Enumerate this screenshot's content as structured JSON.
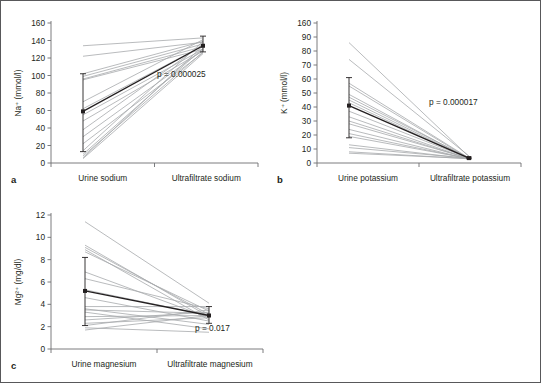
{
  "figure": {
    "background_color": "#ffffff",
    "border_color": "#58585a",
    "mean_color": "#231f20",
    "subject_line_color": "#a7a9ac",
    "axis_color": "#6d6e71"
  },
  "chart_data": [
    {
      "type": "line",
      "panel_letter": "a",
      "title": "",
      "xlabel": "",
      "ylabel": "Na⁺ (mmol/l)",
      "ylim": [
        0,
        160
      ],
      "ytick_labels": [
        "0",
        "20",
        "40",
        "60",
        "80",
        "100",
        "120",
        "140",
        "160"
      ],
      "yticks": [
        0,
        20,
        40,
        60,
        80,
        100,
        120,
        140,
        160
      ],
      "grid": false,
      "legend": "none",
      "categories": [
        "Urine sodium",
        "Ultrafiltrate sodium"
      ],
      "annotation": "p = 0.000025",
      "mean": {
        "values": [
          59,
          134
        ],
        "error_low": [
          13,
          127
        ],
        "error_high": [
          102,
          145
        ]
      },
      "series": [
        {
          "name": "subject-1",
          "values": [
            134,
            143
          ]
        },
        {
          "name": "subject-2",
          "values": [
            122,
            138
          ]
        },
        {
          "name": "subject-3",
          "values": [
            102,
            139
          ]
        },
        {
          "name": "subject-4",
          "values": [
            99,
            136
          ]
        },
        {
          "name": "subject-5",
          "values": [
            96,
            133
          ]
        },
        {
          "name": "subject-6",
          "values": [
            95,
            130
          ]
        },
        {
          "name": "subject-7",
          "values": [
            70,
            141
          ]
        },
        {
          "name": "subject-8",
          "values": [
            62,
            134
          ]
        },
        {
          "name": "subject-9",
          "values": [
            55,
            130
          ]
        },
        {
          "name": "subject-10",
          "values": [
            48,
            128
          ]
        },
        {
          "name": "subject-11",
          "values": [
            38,
            136
          ]
        },
        {
          "name": "subject-12",
          "values": [
            30,
            129
          ]
        },
        {
          "name": "subject-13",
          "values": [
            22,
            126
          ]
        },
        {
          "name": "subject-14",
          "values": [
            14,
            139
          ]
        },
        {
          "name": "subject-15",
          "values": [
            10,
            131
          ]
        },
        {
          "name": "subject-16",
          "values": [
            8,
            127
          ]
        },
        {
          "name": "subject-17",
          "values": [
            6,
            134
          ]
        },
        {
          "name": "subject-18",
          "values": [
            5,
            125
          ]
        }
      ]
    },
    {
      "type": "line",
      "panel_letter": "b",
      "title": "",
      "xlabel": "",
      "ylabel": "K⁺ (mmol/l)",
      "ylim": [
        0,
        100
      ],
      "ytick_labels": [
        "0",
        "10",
        "20",
        "30",
        "40",
        "50",
        "60",
        "70",
        "80",
        "90",
        "160"
      ],
      "yticks": [
        0,
        10,
        20,
        30,
        40,
        50,
        60,
        70,
        80,
        90,
        100
      ],
      "grid": false,
      "legend": "none",
      "categories": [
        "Urine potassium",
        "Ultrafiltrate potassium"
      ],
      "annotation": "p = 0.000017",
      "mean": {
        "values": [
          41,
          3.5
        ],
        "error_low": [
          18,
          3.0
        ],
        "error_high": [
          61,
          4.2
        ]
      },
      "series": [
        {
          "name": "subject-1",
          "values": [
            86,
            4.5
          ]
        },
        {
          "name": "subject-2",
          "values": [
            74,
            5.0
          ]
        },
        {
          "name": "subject-3",
          "values": [
            57,
            3.5
          ]
        },
        {
          "name": "subject-4",
          "values": [
            55,
            3.2
          ]
        },
        {
          "name": "subject-5",
          "values": [
            49,
            3.0
          ]
        },
        {
          "name": "subject-6",
          "values": [
            47,
            3.6
          ]
        },
        {
          "name": "subject-7",
          "values": [
            45,
            3.2
          ]
        },
        {
          "name": "subject-8",
          "values": [
            43,
            3.0
          ]
        },
        {
          "name": "subject-9",
          "values": [
            37,
            3.4
          ]
        },
        {
          "name": "subject-10",
          "values": [
            33,
            3.0
          ]
        },
        {
          "name": "subject-11",
          "values": [
            30,
            3.1
          ]
        },
        {
          "name": "subject-12",
          "values": [
            28,
            3.3
          ]
        },
        {
          "name": "subject-13",
          "values": [
            24,
            2.8
          ]
        },
        {
          "name": "subject-14",
          "values": [
            21,
            3.0
          ]
        },
        {
          "name": "subject-15",
          "values": [
            19,
            3.2
          ]
        },
        {
          "name": "subject-16",
          "values": [
            13,
            3.0
          ]
        },
        {
          "name": "subject-17",
          "values": [
            11,
            3.4
          ]
        },
        {
          "name": "subject-18",
          "values": [
            8,
            3.0
          ]
        },
        {
          "name": "subject-19",
          "values": [
            7,
            3.2
          ]
        }
      ]
    },
    {
      "type": "line",
      "panel_letter": "c",
      "title": "",
      "xlabel": "",
      "ylabel": "Mg²⁺ (mg/dl)",
      "ylim": [
        0,
        12
      ],
      "ytick_labels": [
        "0",
        "2",
        "4",
        "6",
        "8",
        "10",
        "12"
      ],
      "yticks": [
        0,
        2,
        4,
        6,
        8,
        10,
        12
      ],
      "grid": false,
      "legend": "none",
      "categories": [
        "Urine magnesium",
        "Ultrafiltrate magnesium"
      ],
      "annotation": "p = 0.017",
      "mean": {
        "values": [
          5.2,
          3.0
        ],
        "error_low": [
          2.1,
          2.3
        ],
        "error_high": [
          8.2,
          3.8
        ]
      },
      "series": [
        {
          "name": "subject-1",
          "values": [
            11.4,
            4.1
          ]
        },
        {
          "name": "subject-2",
          "values": [
            9.3,
            2.9
          ]
        },
        {
          "name": "subject-3",
          "values": [
            9.1,
            3.1
          ]
        },
        {
          "name": "subject-4",
          "values": [
            8.9,
            2.6
          ]
        },
        {
          "name": "subject-5",
          "values": [
            8.7,
            3.4
          ]
        },
        {
          "name": "subject-6",
          "values": [
            6.9,
            2.8
          ]
        },
        {
          "name": "subject-7",
          "values": [
            6.3,
            3.6
          ]
        },
        {
          "name": "subject-8",
          "values": [
            5.3,
            3.0
          ]
        },
        {
          "name": "subject-9",
          "values": [
            4.6,
            2.5
          ]
        },
        {
          "name": "subject-10",
          "values": [
            3.8,
            3.8
          ]
        },
        {
          "name": "subject-11",
          "values": [
            3.6,
            2.2
          ]
        },
        {
          "name": "subject-12",
          "values": [
            3.5,
            3.2
          ]
        },
        {
          "name": "subject-13",
          "values": [
            3.3,
            1.8
          ]
        },
        {
          "name": "subject-14",
          "values": [
            2.9,
            3.0
          ]
        },
        {
          "name": "subject-15",
          "values": [
            2.6,
            3.3
          ]
        },
        {
          "name": "subject-16",
          "values": [
            2.3,
            2.8
          ]
        },
        {
          "name": "subject-17",
          "values": [
            2.1,
            3.5
          ]
        },
        {
          "name": "subject-18",
          "values": [
            1.9,
            1.5
          ]
        },
        {
          "name": "subject-19",
          "values": [
            1.7,
            3.0
          ]
        }
      ]
    }
  ]
}
